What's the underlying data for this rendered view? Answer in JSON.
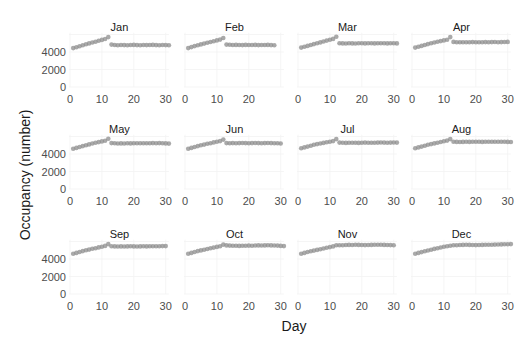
{
  "chart_data": {
    "type": "scatter",
    "title": "",
    "xlabel": "Day",
    "ylabel": "Occupancy (number)",
    "facet_layout": {
      "rows": 3,
      "cols": 4
    },
    "xlim": [
      0,
      31
    ],
    "ylim": [
      0,
      6000
    ],
    "x_ticks": [
      0,
      10,
      20,
      30
    ],
    "y_ticks": [
      0,
      2000,
      4000
    ],
    "grid": true,
    "point_color": "#8c8c8c",
    "panels": [
      {
        "label": "Jan",
        "x_tick_labels": [
          "0",
          "10",
          "20",
          "30"
        ],
        "days": 31,
        "values": [
          4450,
          4550,
          4650,
          4780,
          4880,
          4980,
          5080,
          5180,
          5280,
          5380,
          5480,
          5700,
          4850,
          4800,
          4780,
          4800,
          4790,
          4780,
          4800,
          4810,
          4790,
          4780,
          4800,
          4790,
          4800,
          4810,
          4790,
          4780,
          4800,
          4790,
          4760
        ]
      },
      {
        "label": "Feb",
        "x_tick_labels": [
          "0",
          "10",
          "20"
        ],
        "days": 28,
        "values": [
          4450,
          4560,
          4670,
          4780,
          4870,
          4960,
          5050,
          5140,
          5230,
          5320,
          5420,
          5600,
          4850,
          4820,
          4800,
          4810,
          4800,
          4790,
          4810,
          4800,
          4800,
          4810,
          4790,
          4800,
          4800,
          4810,
          4790,
          4780
        ]
      },
      {
        "label": "Mar",
        "x_tick_labels": [
          "0",
          "10",
          "20",
          "30"
        ],
        "days": 31,
        "values": [
          4500,
          4600,
          4700,
          4800,
          4900,
          5000,
          5100,
          5200,
          5300,
          5400,
          5500,
          5750,
          5000,
          4980,
          4970,
          4990,
          4980,
          4970,
          4990,
          5000,
          4980,
          4990,
          5000,
          4980,
          4990,
          5000,
          4990,
          4980,
          4990,
          5000,
          4980
        ]
      },
      {
        "label": "Apr",
        "x_tick_labels": [
          "0",
          "10",
          "20",
          "30"
        ],
        "days": 30,
        "values": [
          4500,
          4600,
          4700,
          4800,
          4900,
          5000,
          5080,
          5160,
          5240,
          5320,
          5400,
          5700,
          5150,
          5120,
          5110,
          5120,
          5110,
          5120,
          5130,
          5120,
          5110,
          5120,
          5130,
          5120,
          5130,
          5140,
          5120,
          5130,
          5140,
          5150
        ]
      },
      {
        "label": "May",
        "x_tick_labels": [
          "0",
          "10",
          "20",
          "30"
        ],
        "days": 31,
        "values": [
          4600,
          4700,
          4800,
          4900,
          5000,
          5100,
          5200,
          5280,
          5360,
          5440,
          5520,
          5750,
          5250,
          5220,
          5200,
          5210,
          5200,
          5220,
          5210,
          5230,
          5220,
          5230,
          5240,
          5230,
          5240,
          5250,
          5240,
          5250,
          5230,
          5210,
          5190
        ]
      },
      {
        "label": "Jun",
        "x_tick_labels": [
          "0",
          "10",
          "20",
          "30"
        ],
        "days": 30,
        "values": [
          4600,
          4700,
          4800,
          4900,
          5000,
          5080,
          5160,
          5240,
          5320,
          5400,
          5480,
          5650,
          5250,
          5240,
          5250,
          5240,
          5250,
          5260,
          5250,
          5240,
          5250,
          5260,
          5250,
          5240,
          5250,
          5260,
          5250,
          5240,
          5230,
          5200
        ]
      },
      {
        "label": "Jul",
        "x_tick_labels": [
          "0",
          "10",
          "20",
          "30"
        ],
        "days": 31,
        "values": [
          4650,
          4750,
          4850,
          4950,
          5050,
          5130,
          5200,
          5270,
          5340,
          5410,
          5480,
          5700,
          5300,
          5280,
          5270,
          5280,
          5290,
          5280,
          5270,
          5290,
          5300,
          5290,
          5280,
          5290,
          5300,
          5310,
          5300,
          5290,
          5300,
          5310,
          5300
        ]
      },
      {
        "label": "Aug",
        "x_tick_labels": [
          "0",
          "10",
          "20",
          "30"
        ],
        "days": 31,
        "values": [
          4650,
          4750,
          4850,
          4950,
          5050,
          5130,
          5210,
          5290,
          5370,
          5450,
          5530,
          5700,
          5400,
          5380,
          5370,
          5380,
          5390,
          5380,
          5390,
          5400,
          5390,
          5380,
          5390,
          5400,
          5410,
          5400,
          5390,
          5400,
          5390,
          5380,
          5370
        ]
      },
      {
        "label": "Sep",
        "x_tick_labels": [
          "0",
          "10",
          "20",
          "30"
        ],
        "days": 30,
        "values": [
          4600,
          4700,
          4800,
          4900,
          5000,
          5080,
          5160,
          5240,
          5320,
          5400,
          5500,
          5700,
          5450,
          5440,
          5430,
          5440,
          5430,
          5440,
          5450,
          5440,
          5430,
          5440,
          5450,
          5440,
          5450,
          5460,
          5450,
          5460,
          5470,
          5480
        ]
      },
      {
        "label": "Oct",
        "x_tick_labels": [
          "0",
          "10",
          "20",
          "30"
        ],
        "days": 31,
        "values": [
          4600,
          4700,
          4800,
          4900,
          4980,
          5060,
          5140,
          5220,
          5300,
          5380,
          5460,
          5650,
          5550,
          5530,
          5520,
          5510,
          5500,
          5510,
          5520,
          5530,
          5520,
          5540,
          5550,
          5540,
          5550,
          5560,
          5550,
          5540,
          5530,
          5500,
          5480
        ]
      },
      {
        "label": "Nov",
        "x_tick_labels": [
          "0",
          "10",
          "20",
          "30"
        ],
        "days": 30,
        "values": [
          4600,
          4700,
          4800,
          4880,
          4960,
          5040,
          5120,
          5200,
          5280,
          5360,
          5440,
          5560,
          5560,
          5580,
          5600,
          5610,
          5600,
          5620,
          5610,
          5600,
          5590,
          5600,
          5610,
          5620,
          5630,
          5620,
          5610,
          5600,
          5590,
          5580
        ]
      },
      {
        "label": "Dec",
        "x_tick_labels": [
          "0",
          "10",
          "20",
          "30"
        ],
        "days": 31,
        "values": [
          4600,
          4700,
          4790,
          4880,
          4970,
          5060,
          5150,
          5230,
          5310,
          5390,
          5460,
          5520,
          5560,
          5580,
          5600,
          5610,
          5620,
          5610,
          5600,
          5590,
          5600,
          5610,
          5620,
          5630,
          5640,
          5650,
          5660,
          5670,
          5680,
          5690,
          5700
        ]
      }
    ]
  },
  "labels": {
    "xlabel": "Day",
    "ylabel": "Occupancy (number)"
  }
}
